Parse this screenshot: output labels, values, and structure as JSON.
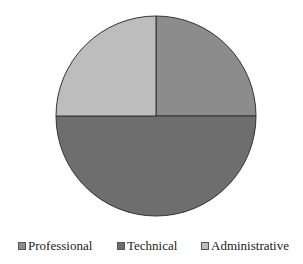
{
  "chart_data": {
    "type": "pie",
    "title": "",
    "categories": [
      "Professional",
      "Technical",
      "Administrative"
    ],
    "values": [
      25,
      50,
      25
    ],
    "unit": "%",
    "colors": [
      "#8c8c8c",
      "#6e6e6e",
      "#bdbdbd"
    ],
    "start_angle_deg": 0,
    "direction": "clockwise from 12 o'clock",
    "legend_position": "bottom",
    "data_labels": false
  },
  "legend": {
    "items": [
      {
        "label": "Professional",
        "color": "#8c8c8c"
      },
      {
        "label": "Technical",
        "color": "#6e6e6e"
      },
      {
        "label": "Administrative",
        "color": "#bdbdbd"
      }
    ]
  }
}
